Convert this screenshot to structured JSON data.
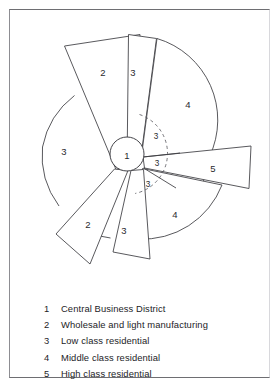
{
  "figure": {
    "center_label": "1"
  },
  "diagram": {
    "zone_labels": [
      {
        "id": "cbd",
        "text": "1",
        "x": 127,
        "y": 155
      },
      {
        "id": "upper-left-wholesale",
        "text": "2",
        "x": 103,
        "y": 72
      },
      {
        "id": "upper-low-class",
        "text": "3",
        "x": 133,
        "y": 72
      },
      {
        "id": "upper-right-middle",
        "text": "4",
        "x": 188,
        "y": 104
      },
      {
        "id": "left-low-class",
        "text": "3",
        "x": 64,
        "y": 151
      },
      {
        "id": "inner-upper-low-class",
        "text": "3",
        "x": 156,
        "y": 136
      },
      {
        "id": "inner-mid-low-class",
        "text": "3",
        "x": 157,
        "y": 163
      },
      {
        "id": "inner-lower-low-class",
        "text": "3",
        "x": 148,
        "y": 184
      },
      {
        "id": "right-high-class",
        "text": "5",
        "x": 213,
        "y": 168
      },
      {
        "id": "lower-right-middle",
        "text": "4",
        "x": 175,
        "y": 214
      },
      {
        "id": "lower-low-class",
        "text": "3",
        "x": 124,
        "y": 230
      },
      {
        "id": "lower-left-wholesale",
        "text": "2",
        "x": 88,
        "y": 224
      }
    ],
    "colors": {
      "stroke": "#3b3b40",
      "dashed_stroke": "#5c5c62",
      "fill": "#ffffff",
      "frame": "#6e6e72",
      "text": "#232327"
    },
    "geometry": {
      "center_x": 127,
      "center_y": 154,
      "cbd_radius": 17,
      "outer_ring_radius": 85,
      "dashed_arc_radius": 41
    }
  },
  "legend": {
    "items": [
      {
        "key": "1",
        "label": "Central Business District"
      },
      {
        "key": "2",
        "label": "Wholesale and light manufacturing"
      },
      {
        "key": "3",
        "label": "Low class residential"
      },
      {
        "key": "4",
        "label": "Middle class residential"
      },
      {
        "key": "5",
        "label": "High class residential"
      }
    ]
  }
}
